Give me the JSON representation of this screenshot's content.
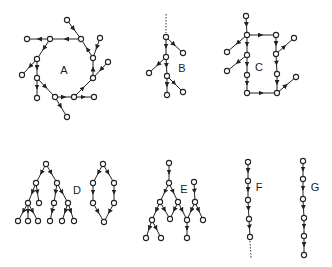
{
  "colors": {
    "ink": "#222222",
    "background": "#ffffff"
  },
  "graphs": [
    {
      "id": "A",
      "label": "A",
      "label_pos": [
        64,
        70
      ],
      "nodes": [
        [
          50,
          39
        ],
        [
          81,
          39
        ],
        [
          93,
          58
        ],
        [
          93,
          78
        ],
        [
          74,
          97
        ],
        [
          55,
          97
        ],
        [
          37,
          78
        ],
        [
          37,
          59
        ],
        [
          27,
          39
        ],
        [
          67,
          20
        ],
        [
          100,
          38
        ],
        [
          108,
          62
        ],
        [
          94,
          97
        ],
        [
          67,
          117
        ],
        [
          37,
          98
        ],
        [
          22,
          75
        ]
      ],
      "edges": [
        [
          1,
          0
        ],
        [
          0,
          7
        ],
        [
          7,
          6
        ],
        [
          6,
          5
        ],
        [
          5,
          4
        ],
        [
          4,
          3
        ],
        [
          3,
          2
        ],
        [
          2,
          1
        ],
        [
          0,
          8
        ],
        [
          9,
          1
        ],
        [
          10,
          2
        ],
        [
          11,
          3
        ],
        [
          4,
          12
        ],
        [
          5,
          13
        ],
        [
          6,
          14
        ],
        [
          7,
          15
        ]
      ],
      "dotted": []
    },
    {
      "id": "B",
      "label": "B",
      "label_pos": [
        182,
        68
      ],
      "nodes": [
        [
          166,
          37
        ],
        [
          183,
          53
        ],
        [
          166,
          57
        ],
        [
          149,
          73
        ],
        [
          167,
          76
        ],
        [
          183,
          92
        ],
        [
          167,
          95
        ]
      ],
      "edges": [
        [
          0,
          1
        ],
        [
          0,
          2
        ],
        [
          2,
          3
        ],
        [
          2,
          4
        ],
        [
          4,
          5
        ],
        [
          4,
          6
        ]
      ],
      "dotted": [
        [
          [
            166,
            14
          ],
          [
            166,
            33
          ]
        ]
      ]
    },
    {
      "id": "C",
      "label": "C",
      "label_pos": [
        259,
        67
      ],
      "nodes": [
        [
          246,
          16
        ],
        [
          247,
          35
        ],
        [
          247,
          55
        ],
        [
          247,
          75
        ],
        [
          247,
          93
        ],
        [
          276,
          35
        ],
        [
          276,
          54
        ],
        [
          277,
          74
        ],
        [
          277,
          93
        ],
        [
          227,
          52
        ],
        [
          227,
          71
        ],
        [
          294,
          38
        ],
        [
          296,
          77
        ]
      ],
      "edges": [
        [
          0,
          1
        ],
        [
          1,
          2
        ],
        [
          2,
          3
        ],
        [
          3,
          4
        ],
        [
          1,
          5
        ],
        [
          5,
          6
        ],
        [
          6,
          7
        ],
        [
          7,
          8
        ],
        [
          4,
          8
        ],
        [
          1,
          9
        ],
        [
          2,
          10
        ],
        [
          6,
          11
        ],
        [
          8,
          12
        ]
      ],
      "dotted": []
    },
    {
      "id": "D",
      "label": "D",
      "label_pos": [
        77,
        190
      ],
      "nodes": [
        [
          46,
          164
        ],
        [
          36,
          183
        ],
        [
          57,
          183
        ],
        [
          28,
          203
        ],
        [
          39,
          203
        ],
        [
          54,
          203
        ],
        [
          68,
          203
        ],
        [
          18,
          221
        ],
        [
          28,
          221
        ],
        [
          38,
          221
        ],
        [
          50,
          221
        ],
        [
          62,
          221
        ],
        [
          74,
          221
        ],
        [
          103,
          164
        ],
        [
          93,
          183
        ],
        [
          114,
          183
        ],
        [
          93,
          203
        ],
        [
          114,
          203
        ],
        [
          104,
          222
        ]
      ],
      "edges": [
        [
          0,
          1
        ],
        [
          0,
          2
        ],
        [
          1,
          3
        ],
        [
          1,
          4
        ],
        [
          2,
          5
        ],
        [
          2,
          6
        ],
        [
          3,
          7
        ],
        [
          3,
          8
        ],
        [
          3,
          9
        ],
        [
          5,
          10
        ],
        [
          6,
          11
        ],
        [
          6,
          12
        ],
        [
          13,
          14
        ],
        [
          13,
          15
        ],
        [
          14,
          16
        ],
        [
          15,
          17
        ],
        [
          16,
          18
        ],
        [
          17,
          18
        ]
      ],
      "dotted": []
    },
    {
      "id": "E",
      "label": "E",
      "label_pos": [
        184,
        189
      ],
      "nodes": [
        [
          169,
          163
        ],
        [
          169,
          183
        ],
        [
          160,
          202
        ],
        [
          178,
          202
        ],
        [
          170,
          219
        ],
        [
          152,
          220
        ],
        [
          146,
          238
        ],
        [
          161,
          238
        ],
        [
          187,
          220
        ],
        [
          187,
          238
        ],
        [
          195,
          202
        ],
        [
          194,
          182
        ],
        [
          203,
          220
        ]
      ],
      "edges": [
        [
          0,
          1
        ],
        [
          1,
          2
        ],
        [
          1,
          3
        ],
        [
          2,
          4
        ],
        [
          3,
          4
        ],
        [
          2,
          5
        ],
        [
          5,
          6
        ],
        [
          5,
          7
        ],
        [
          3,
          8
        ],
        [
          8,
          9
        ],
        [
          11,
          10
        ],
        [
          10,
          8
        ],
        [
          10,
          12
        ]
      ],
      "dotted": []
    },
    {
      "id": "F",
      "label": "F",
      "label_pos": [
        259,
        187
      ],
      "nodes": [
        [
          248,
          162
        ],
        [
          248,
          181
        ],
        [
          248,
          200
        ],
        [
          249,
          219
        ],
        [
          250,
          237
        ]
      ],
      "edges": [
        [
          0,
          1
        ],
        [
          1,
          2
        ],
        [
          2,
          3
        ],
        [
          3,
          4
        ]
      ],
      "dotted": [
        [
          [
            250,
            241
          ],
          [
            251,
            258
          ]
        ]
      ]
    },
    {
      "id": "G",
      "label": "G",
      "label_pos": [
        315,
        187
      ],
      "nodes": [
        [
          303,
          161
        ],
        [
          303,
          179
        ],
        [
          303,
          199
        ],
        [
          304,
          218
        ],
        [
          304,
          236
        ],
        [
          304,
          255
        ]
      ],
      "edges": [
        [
          0,
          1
        ],
        [
          1,
          2
        ],
        [
          2,
          3
        ],
        [
          3,
          4
        ],
        [
          4,
          5
        ]
      ],
      "dotted": []
    }
  ]
}
